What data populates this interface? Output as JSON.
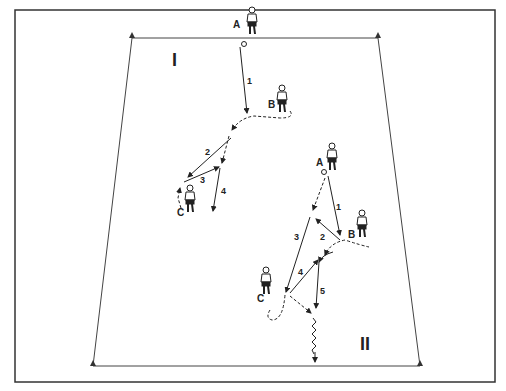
{
  "diagram": {
    "zones": [
      {
        "label": "I"
      },
      {
        "label": "II"
      }
    ],
    "players": {
      "zone1": [
        {
          "label": "A"
        },
        {
          "label": "B"
        },
        {
          "label": "C"
        }
      ],
      "zone2": [
        {
          "label": "A"
        },
        {
          "label": "B"
        },
        {
          "label": "C"
        }
      ]
    },
    "steps": {
      "zone1": [
        "1",
        "2",
        "3",
        "4"
      ],
      "zone2": [
        "1",
        "2",
        "3",
        "4",
        "5"
      ]
    },
    "colors": {
      "line": "#222222",
      "frame": "#333333",
      "background": "#ffffff"
    }
  }
}
